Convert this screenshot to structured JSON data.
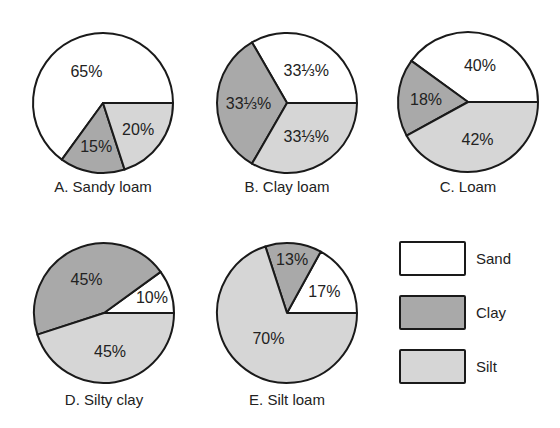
{
  "colors": {
    "sand": "#ffffff",
    "clay": "#a9a9a9",
    "silt": "#d6d6d6",
    "stroke": "#1a1a1a"
  },
  "legend": [
    {
      "key": "sand",
      "label": "Sand"
    },
    {
      "key": "clay",
      "label": "Clay"
    },
    {
      "key": "silt",
      "label": "Silt"
    }
  ],
  "chart_data": [
    {
      "type": "pie",
      "title": "A. Sandy loam",
      "categories": [
        "Sand",
        "Clay",
        "Silt"
      ],
      "values": [
        65,
        15,
        20
      ],
      "labels": [
        "65%",
        "15%",
        "20%"
      ]
    },
    {
      "type": "pie",
      "title": "B. Clay loam",
      "categories": [
        "Sand",
        "Clay",
        "Silt"
      ],
      "values": [
        33.333,
        33.333,
        33.333
      ],
      "labels": [
        "33⅓%",
        "33⅓%",
        "33⅓%"
      ]
    },
    {
      "type": "pie",
      "title": "C. Loam",
      "categories": [
        "Sand",
        "Clay",
        "Silt"
      ],
      "values": [
        40,
        18,
        42
      ],
      "labels": [
        "40%",
        "18%",
        "42%"
      ]
    },
    {
      "type": "pie",
      "title": "D. Silty clay",
      "categories": [
        "Sand",
        "Clay",
        "Silt"
      ],
      "values": [
        10,
        45,
        45
      ],
      "labels": [
        "10%",
        "45%",
        "45%"
      ]
    },
    {
      "type": "pie",
      "title": "E. Silt loam",
      "categories": [
        "Sand",
        "Clay",
        "Silt"
      ],
      "values": [
        17,
        13,
        70
      ],
      "labels": [
        "17%",
        "13%",
        "70%"
      ]
    }
  ],
  "layout": [
    {
      "cx": 103,
      "cy": 103,
      "r": 70,
      "title_y": 192,
      "label_r": [
        0.52,
        0.62,
        0.62
      ]
    },
    {
      "cx": 287,
      "cy": 103,
      "r": 70,
      "title_y": 192,
      "label_r": [
        0.55,
        0.55,
        0.55
      ]
    },
    {
      "cx": 468,
      "cy": 102,
      "r": 70,
      "title_y": 192,
      "label_r": [
        0.55,
        0.6,
        0.55
      ]
    },
    {
      "cx": 104,
      "cy": 313,
      "r": 70,
      "title_y": 405,
      "label_r": [
        0.72,
        0.55,
        0.55
      ]
    },
    {
      "cx": 287,
      "cy": 313,
      "r": 70,
      "title_y": 405,
      "label_r": [
        0.62,
        0.78,
        0.45
      ]
    }
  ],
  "legend_layout": {
    "x": 400,
    "w": 65,
    "h": 33,
    "ys": [
      242,
      296,
      350
    ],
    "label_x": 476
  }
}
